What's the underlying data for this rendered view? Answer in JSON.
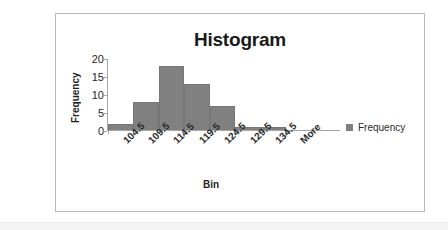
{
  "chart_data": {
    "type": "bar",
    "title": "Histogram",
    "xlabel": "Bin",
    "ylabel": "Frequency",
    "categories": [
      "104.5",
      "109.5",
      "114.5",
      "119.5",
      "124.5",
      "129.5",
      "134.5",
      "More"
    ],
    "values": [
      2,
      8,
      18,
      13,
      7,
      1,
      1,
      0
    ],
    "ylim": [
      0,
      20
    ],
    "yticks": [
      0,
      5,
      10,
      15,
      20
    ],
    "ytick_labels": [
      "0",
      "5",
      "10",
      "15",
      "20"
    ],
    "grid": false,
    "legend": {
      "position": "right",
      "entries": [
        {
          "label": "Frequency",
          "color": "#808080"
        }
      ]
    },
    "series": [
      {
        "name": "Frequency",
        "color": "#808080",
        "values": [
          2,
          8,
          18,
          13,
          7,
          1,
          1,
          0
        ]
      }
    ]
  },
  "colors": {
    "bar": "#808080",
    "axis": "#a6a6a6",
    "frame": "#b9b9b9",
    "text": "#1f1f1f",
    "background": "#ffffff"
  }
}
